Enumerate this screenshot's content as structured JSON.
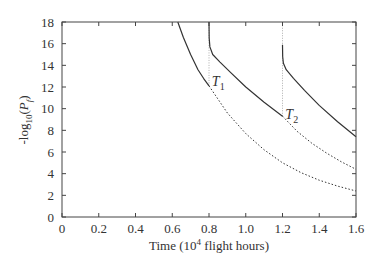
{
  "chart_data": {
    "type": "line",
    "title": "",
    "xlabel": "Time (10^4 flight hours)",
    "xlabel_parts": {
      "pre": "Time (10",
      "sup": "4",
      "post": " flight hours)"
    },
    "ylabel": "-log10(Pf)",
    "ylabel_parts": {
      "pre": "-log",
      "sub1": "10",
      "mid": "(",
      "var": "P",
      "sub2": "f",
      "post": ")"
    },
    "xlim": [
      0,
      1.6
    ],
    "ylim": [
      0,
      18
    ],
    "xticks": [
      "0",
      "0.2",
      "0.4",
      "0.6",
      "0.8",
      "1.0",
      "1.2",
      "1.4",
      "1.6"
    ],
    "xtick_values": [
      0,
      0.2,
      0.4,
      0.6,
      0.8,
      1.0,
      1.2,
      1.4,
      1.6
    ],
    "yticks": [
      "0",
      "2",
      "4",
      "6",
      "8",
      "10",
      "12",
      "14",
      "16",
      "18"
    ],
    "ytick_values": [
      0,
      2,
      4,
      6,
      8,
      10,
      12,
      14,
      16,
      18
    ],
    "grid": false,
    "legend": null,
    "annotations": [
      {
        "label": "T",
        "sub": "1",
        "x": 0.81,
        "y": 12.3
      },
      {
        "label": "T",
        "sub": "2",
        "x": 1.21,
        "y": 9.2
      }
    ],
    "inspection_lines": [
      {
        "x": 0.8,
        "y_from": 12.1,
        "y_to": 18
      },
      {
        "x": 1.2,
        "y_from": 9.3,
        "y_to": 18
      }
    ],
    "series": [
      {
        "name": "Before inspection",
        "style": "solid",
        "x": [
          0.63,
          0.66,
          0.7,
          0.74,
          0.77,
          0.8
        ],
        "y": [
          18.0,
          16.6,
          15.0,
          13.6,
          12.8,
          12.1
        ]
      },
      {
        "name": "No inspection (continuation 1)",
        "style": "dotted",
        "x": [
          0.8,
          0.9,
          1.0,
          1.1,
          1.2,
          1.3,
          1.4,
          1.5,
          1.6
        ],
        "y": [
          12.1,
          9.6,
          7.7,
          6.2,
          5.0,
          4.1,
          3.4,
          2.85,
          2.4
        ]
      },
      {
        "name": "After inspection T1",
        "style": "solid",
        "x": [
          0.8,
          0.801,
          0.805,
          0.82,
          0.86,
          0.92,
          1.0,
          1.1,
          1.2
        ],
        "y": [
          18.0,
          16.5,
          15.7,
          15.0,
          14.3,
          13.3,
          12.0,
          10.6,
          9.3
        ]
      },
      {
        "name": "No inspection (continuation 2)",
        "style": "dotted",
        "x": [
          1.2,
          1.28,
          1.36,
          1.44,
          1.52,
          1.6
        ],
        "y": [
          9.3,
          7.9,
          6.8,
          5.9,
          5.1,
          4.4
        ]
      },
      {
        "name": "After inspection T2",
        "style": "solid",
        "x": [
          1.2,
          1.201,
          1.205,
          1.22,
          1.26,
          1.32,
          1.4,
          1.5,
          1.6
        ],
        "y": [
          15.9,
          14.8,
          14.2,
          13.6,
          12.8,
          11.7,
          10.3,
          8.8,
          7.4
        ]
      }
    ]
  }
}
